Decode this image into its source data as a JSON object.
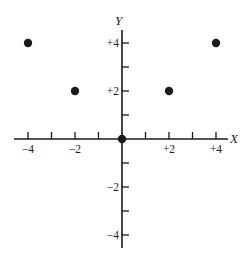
{
  "chart_data": {
    "type": "scatter",
    "title": "",
    "xlabel": "X",
    "ylabel": "Y",
    "xlim": [
      -4.5,
      4.5
    ],
    "ylim": [
      -5,
      4.5
    ],
    "grid": false,
    "legend": null,
    "x_ticks": [
      -4,
      -3,
      -2,
      -1,
      1,
      2,
      3,
      4
    ],
    "y_ticks": [
      -4,
      -3,
      -2,
      -1,
      1,
      2,
      3,
      4
    ],
    "x_tick_labels": [
      {
        "value": -4,
        "label": "−4"
      },
      {
        "value": -2,
        "label": "−2"
      },
      {
        "value": 2,
        "label": "+2"
      },
      {
        "value": 4,
        "label": "+4"
      }
    ],
    "y_tick_labels": [
      {
        "value": 4,
        "label": "+4"
      },
      {
        "value": 2,
        "label": "+2"
      },
      {
        "value": -2,
        "label": "−2"
      },
      {
        "value": -4,
        "label": "−4"
      }
    ],
    "series": [
      {
        "name": "points",
        "x": [
          -4,
          -2,
          0,
          2,
          4
        ],
        "y": [
          4,
          2,
          0,
          2,
          4
        ]
      }
    ]
  },
  "layout": {
    "origin_px": [
      122,
      139
    ],
    "x_unit_px": 23.5,
    "y_unit_px": 24,
    "x_axis_px": [
      14,
      228
    ],
    "y_axis_px": [
      30,
      248
    ],
    "point_radius": 4.2,
    "color": "#1a1a1a"
  }
}
